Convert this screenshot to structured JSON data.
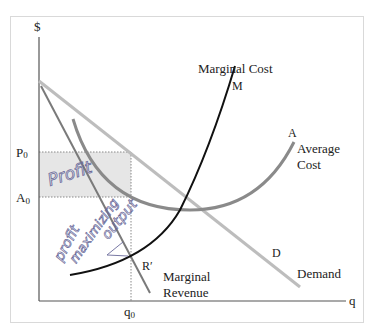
{
  "figure": {
    "axes": {
      "y_label": "$",
      "x_label": "q"
    },
    "price_labels": {
      "p0": "P0_label",
      "p0_main": "P",
      "p0_sub": "0",
      "a0_main": "A",
      "a0_sub": "0"
    },
    "quantity_labels": {
      "q0_main": "q",
      "q0_sub": "0"
    },
    "curves": {
      "marginal_cost": {
        "title": "Marginal Cost",
        "point": "M"
      },
      "average_cost": {
        "title_line1": "Average",
        "title_line2": "Cost",
        "point": "A"
      },
      "demand": {
        "title": "Demand",
        "point": "D"
      },
      "marginal_revenue": {
        "title_line1": "Marginal",
        "title_line2": "Revenue",
        "point": "R′"
      }
    },
    "annotations": {
      "handwritten_profit": "Profit",
      "handwritten_output_line1": "profit",
      "handwritten_output_line2": "maximizing",
      "handwritten_output_line3": "output"
    },
    "colors": {
      "axis": "#555555",
      "demand": "#bdbdbd",
      "marginal_revenue": "#7a7a7a",
      "average_cost": "#8a8a8a",
      "marginal_cost": "#111111",
      "profit_area": "#e6e6e6",
      "handwriting": "#6a6a9a",
      "frame": "#d9d9d9"
    }
  }
}
